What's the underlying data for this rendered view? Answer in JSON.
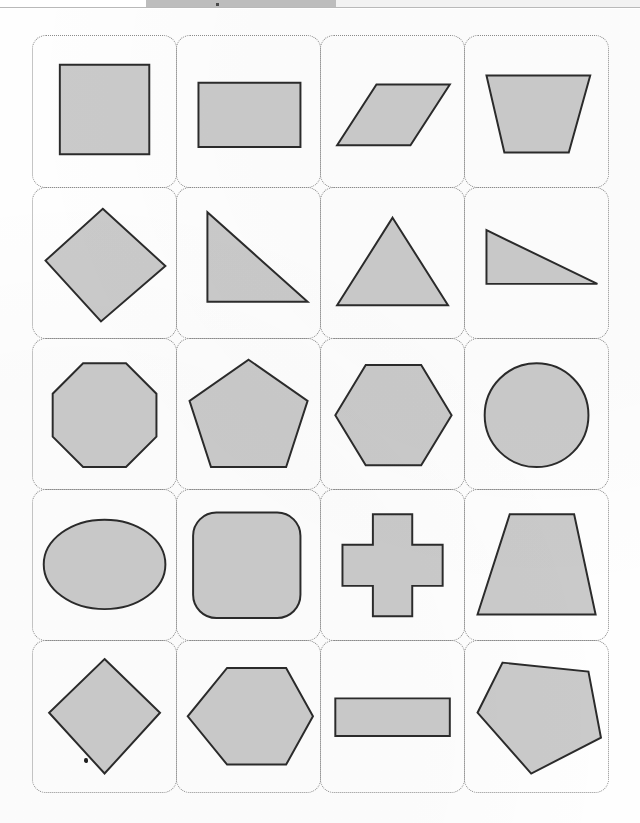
{
  "document": {
    "title": "Geometric Shapes Worksheet",
    "background_color": "#fefefe"
  },
  "top_chrome": {
    "ghost_text": "",
    "tab_color": "#bdbdbd",
    "rule_color": "#b9b9b9"
  },
  "grid": {
    "columns": 4,
    "rows": 5,
    "cell_border_color": "#8c8c8c",
    "cell_border_style": "dotted",
    "cell_corner_radius": "14px",
    "shape_fill": "#cacaca",
    "shape_stroke": "#2b2b2b",
    "cells": [
      {
        "id": "r1c1",
        "name": "square",
        "label": "Square",
        "row": 1,
        "col": 1,
        "kind": "polygon",
        "points": "30,18 130,18 130,118 30,118",
        "viewbox": "0 0 160 140"
      },
      {
        "id": "r1c2",
        "name": "rectangle",
        "label": "Rectangle",
        "row": 1,
        "col": 2,
        "kind": "polygon",
        "points": "24,38 138,38 138,110 24,110",
        "viewbox": "0 0 160 140"
      },
      {
        "id": "r1c3",
        "name": "parallelogram",
        "label": "Parallelogram",
        "row": 1,
        "col": 3,
        "kind": "polygon",
        "points": "62,40 144,40 100,108 18,108",
        "viewbox": "0 0 160 140"
      },
      {
        "id": "r1c4",
        "name": "trapezoid-wide-top",
        "label": "Trapezoid (wide top)",
        "row": 1,
        "col": 4,
        "kind": "polygon",
        "points": "24,30 140,30 116,116 44,116",
        "viewbox": "0 0 160 140"
      },
      {
        "id": "r2c1",
        "name": "rhombus-square-rotated",
        "label": "Rotated square (diamond)",
        "row": 2,
        "col": 1,
        "kind": "polygon",
        "points": "78,14 148,78 76,140 14,72",
        "viewbox": "0 0 160 150"
      },
      {
        "id": "r2c2",
        "name": "right-triangle-tall",
        "label": "Right triangle",
        "row": 2,
        "col": 2,
        "kind": "polygon",
        "points": "34,18 34,118 146,118",
        "viewbox": "0 0 160 150"
      },
      {
        "id": "r2c3",
        "name": "isosceles-triangle",
        "label": "Isosceles triangle",
        "row": 2,
        "col": 3,
        "kind": "polygon",
        "points": "80,24 142,122 18,122",
        "viewbox": "0 0 160 150"
      },
      {
        "id": "r2c4",
        "name": "right-triangle-flat",
        "label": "Flat right triangle",
        "row": 2,
        "col": 4,
        "kind": "polygon",
        "points": "24,38 24,98 148,98",
        "viewbox": "0 0 160 150"
      },
      {
        "id": "r3c1",
        "name": "octagon",
        "label": "Octagon",
        "row": 3,
        "col": 1,
        "kind": "polygon",
        "points": "56,18 104,18 138,52 138,100 104,134 56,134 22,100 22,52",
        "viewbox": "0 0 160 150"
      },
      {
        "id": "r3c2",
        "name": "pentagon",
        "label": "Pentagon",
        "row": 3,
        "col": 2,
        "kind": "polygon",
        "points": "80,14 146,60 122,134 38,134 14,60",
        "viewbox": "0 0 160 150"
      },
      {
        "id": "r3c3",
        "name": "hexagon",
        "label": "Hexagon",
        "row": 3,
        "col": 3,
        "kind": "polygon",
        "points": "50,20 112,20 146,76 112,132 50,132 16,76",
        "viewbox": "0 0 160 150"
      },
      {
        "id": "r3c4",
        "name": "circle",
        "label": "Circle",
        "row": 3,
        "col": 4,
        "kind": "circle",
        "cx": 80,
        "cy": 76,
        "r": 58,
        "viewbox": "0 0 160 150"
      },
      {
        "id": "r4c1",
        "name": "ellipse",
        "label": "Ellipse",
        "row": 4,
        "col": 1,
        "kind": "ellipse",
        "cx": 80,
        "cy": 74,
        "rx": 68,
        "ry": 50,
        "viewbox": "0 0 160 150"
      },
      {
        "id": "r4c2",
        "name": "rounded-square",
        "label": "Rounded square",
        "row": 4,
        "col": 2,
        "kind": "rrect",
        "x": 18,
        "y": 16,
        "w": 120,
        "h": 118,
        "rx": 26,
        "viewbox": "0 0 160 150"
      },
      {
        "id": "r4c3",
        "name": "cross",
        "label": "Cross (plus)",
        "row": 4,
        "col": 3,
        "kind": "polygon",
        "points": "58,18 102,18 102,52 136,52 136,98 102,98 102,132 58,132 58,98 24,98 24,52 58,52",
        "viewbox": "0 0 160 150"
      },
      {
        "id": "r4c4",
        "name": "trapezoid-wide-base",
        "label": "Trapezoid (wide base)",
        "row": 4,
        "col": 4,
        "kind": "polygon",
        "points": "50,18 122,18 146,130 14,130",
        "viewbox": "0 0 160 150"
      },
      {
        "id": "r5c1",
        "name": "rhombus-tall",
        "label": "Rhombus",
        "row": 5,
        "col": 1,
        "kind": "polygon",
        "points": "80,12 142,72 80,140 18,72",
        "viewbox": "0 0 160 152"
      },
      {
        "id": "r5c2",
        "name": "hexagon-wide",
        "label": "Wide hexagon",
        "row": 5,
        "col": 2,
        "kind": "polygon",
        "points": "56,22 122,22 152,76 122,130 56,130 12,76",
        "viewbox": "0 0 160 152"
      },
      {
        "id": "r5c3",
        "name": "thin-rectangle",
        "label": "Thin rectangle",
        "row": 5,
        "col": 3,
        "kind": "polygon",
        "points": "16,56 144,56 144,98 16,98",
        "viewbox": "0 0 160 152"
      },
      {
        "id": "r5c4",
        "name": "pentagon-rotated",
        "label": "Rotated pentagon",
        "row": 5,
        "col": 4,
        "kind": "polygon",
        "points": "42,16 138,26 152,100 74,140 14,72",
        "viewbox": "0 0 160 152"
      }
    ]
  }
}
